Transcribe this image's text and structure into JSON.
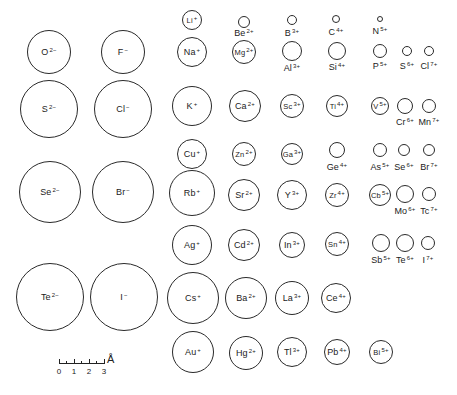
{
  "diagram": {
    "ions": [
      {
        "symbol": "O",
        "charge": "2−",
        "cx": 49,
        "cy": 52,
        "r": 22,
        "label_inside": true
      },
      {
        "symbol": "F",
        "charge": "−",
        "cx": 123,
        "cy": 52,
        "r": 22,
        "label_inside": true
      },
      {
        "symbol": "S",
        "charge": "2−",
        "cx": 49,
        "cy": 109,
        "r": 29,
        "label_inside": true
      },
      {
        "symbol": "Cl",
        "charge": "−",
        "cx": 123,
        "cy": 109,
        "r": 29,
        "label_inside": true
      },
      {
        "symbol": "Se",
        "charge": "2−",
        "cx": 50,
        "cy": 192,
        "r": 31,
        "label_inside": true
      },
      {
        "symbol": "Br",
        "charge": "−",
        "cx": 123,
        "cy": 192,
        "r": 31,
        "label_inside": true
      },
      {
        "symbol": "Te",
        "charge": "2−",
        "cx": 50,
        "cy": 297,
        "r": 34,
        "label_inside": true
      },
      {
        "symbol": "I",
        "charge": "−",
        "cx": 124,
        "cy": 297,
        "r": 34,
        "label_inside": true
      },
      {
        "symbol": "Li",
        "charge": "+",
        "cx": 192,
        "cy": 20,
        "r": 10,
        "label_inside": true
      },
      {
        "symbol": "Na",
        "charge": "+",
        "cx": 192,
        "cy": 52,
        "r": 15,
        "label_inside": true
      },
      {
        "symbol": "K",
        "charge": "+",
        "cx": 192,
        "cy": 106,
        "r": 20,
        "label_inside": true
      },
      {
        "symbol": "Cu",
        "charge": "+",
        "cx": 192,
        "cy": 154,
        "r": 15,
        "label_inside": true
      },
      {
        "symbol": "Rb",
        "charge": "+",
        "cx": 192,
        "cy": 193,
        "r": 23,
        "label_inside": true
      },
      {
        "symbol": "Ag",
        "charge": "+",
        "cx": 192,
        "cy": 245,
        "r": 20,
        "label_inside": true
      },
      {
        "symbol": "Cs",
        "charge": "+",
        "cx": 193,
        "cy": 298,
        "r": 26,
        "label_inside": true
      },
      {
        "symbol": "Au",
        "charge": "+",
        "cx": 193,
        "cy": 352,
        "r": 21,
        "label_inside": true
      },
      {
        "symbol": "Be",
        "charge": "2+",
        "cx": 244,
        "cy": 22,
        "r": 6,
        "label_inside": false,
        "ly": 33
      },
      {
        "symbol": "Mg",
        "charge": "2+",
        "cx": 244,
        "cy": 52,
        "r": 12,
        "label_inside": true
      },
      {
        "symbol": "Ca",
        "charge": "2+",
        "cx": 245,
        "cy": 106,
        "r": 16,
        "label_inside": true
      },
      {
        "symbol": "Zn",
        "charge": "2+",
        "cx": 244,
        "cy": 154,
        "r": 12,
        "label_inside": true
      },
      {
        "symbol": "Sr",
        "charge": "2+",
        "cx": 244,
        "cy": 195,
        "r": 16,
        "label_inside": true
      },
      {
        "symbol": "Cd",
        "charge": "2+",
        "cx": 244,
        "cy": 245,
        "r": 16,
        "label_inside": true
      },
      {
        "symbol": "Ba",
        "charge": "2+",
        "cx": 246,
        "cy": 298,
        "r": 21,
        "label_inside": true
      },
      {
        "symbol": "Hg",
        "charge": "2+",
        "cx": 246,
        "cy": 353,
        "r": 17,
        "label_inside": true
      },
      {
        "symbol": "B",
        "charge": "3+",
        "cx": 292,
        "cy": 20,
        "r": 5,
        "label_inside": false,
        "ly": 33
      },
      {
        "symbol": "Al",
        "charge": "3+",
        "cx": 292,
        "cy": 51,
        "r": 10,
        "label_inside": false,
        "ly": 68
      },
      {
        "symbol": "Sc",
        "charge": "3+",
        "cx": 292,
        "cy": 106,
        "r": 12,
        "label_inside": true
      },
      {
        "symbol": "Ga",
        "charge": "3+",
        "cx": 292,
        "cy": 154,
        "r": 11,
        "label_inside": true
      },
      {
        "symbol": "Y",
        "charge": "3+",
        "cx": 292,
        "cy": 195,
        "r": 15,
        "label_inside": true
      },
      {
        "symbol": "In",
        "charge": "3+",
        "cx": 292,
        "cy": 245,
        "r": 13,
        "label_inside": true
      },
      {
        "symbol": "La",
        "charge": "3+",
        "cx": 292,
        "cy": 298,
        "r": 17,
        "label_inside": true
      },
      {
        "symbol": "Tl",
        "charge": "3+",
        "cx": 292,
        "cy": 352,
        "r": 15,
        "label_inside": true
      },
      {
        "symbol": "C",
        "charge": "4+",
        "cx": 336,
        "cy": 19,
        "r": 4,
        "label_inside": false,
        "ly": 32
      },
      {
        "symbol": "Si",
        "charge": "4+",
        "cx": 337,
        "cy": 51,
        "r": 9,
        "label_inside": false,
        "ly": 67
      },
      {
        "symbol": "Ti",
        "charge": "4+",
        "cx": 337,
        "cy": 106,
        "r": 11,
        "label_inside": true
      },
      {
        "symbol": "Ge",
        "charge": "4+",
        "cx": 337,
        "cy": 150,
        "r": 8,
        "label_inside": false,
        "ly": 167
      },
      {
        "symbol": "Zr",
        "charge": "4+",
        "cx": 337,
        "cy": 195,
        "r": 12,
        "label_inside": true
      },
      {
        "symbol": "Sn",
        "charge": "4+",
        "cx": 337,
        "cy": 244,
        "r": 12,
        "label_inside": true
      },
      {
        "symbol": "Ce",
        "charge": "4+",
        "cx": 336,
        "cy": 298,
        "r": 15,
        "label_inside": true
      },
      {
        "symbol": "Pb",
        "charge": "4+",
        "cx": 337,
        "cy": 352,
        "r": 13,
        "label_inside": true
      },
      {
        "symbol": "N",
        "charge": "5+",
        "cx": 380,
        "cy": 19,
        "r": 3,
        "label_inside": false,
        "ly": 31
      },
      {
        "symbol": "P",
        "charge": "5+",
        "cx": 380,
        "cy": 51,
        "r": 7,
        "label_inside": false,
        "ly": 66
      },
      {
        "symbol": "V",
        "charge": "5+",
        "cx": 380,
        "cy": 106,
        "r": 9,
        "label_inside": true
      },
      {
        "symbol": "As",
        "charge": "5+",
        "cx": 380,
        "cy": 150,
        "r": 7,
        "label_inside": false,
        "ly": 167
      },
      {
        "symbol": "Cb",
        "charge": "5+",
        "cx": 380,
        "cy": 195,
        "r": 11,
        "label_inside": true
      },
      {
        "symbol": "Sb",
        "charge": "5+",
        "cx": 381,
        "cy": 243,
        "r": 9,
        "label_inside": false,
        "ly": 260
      },
      {
        "symbol": "Bi",
        "charge": "5+",
        "cx": 381,
        "cy": 352,
        "r": 12,
        "label_inside": true
      },
      {
        "symbol": "S",
        "charge": "6+",
        "cx": 407,
        "cy": 51,
        "r": 5,
        "label_inside": false,
        "ly": 66
      },
      {
        "symbol": "Cr",
        "charge": "6+",
        "cx": 405,
        "cy": 106,
        "r": 8,
        "label_inside": false,
        "ly": 122
      },
      {
        "symbol": "Se",
        "charge": "6+",
        "cx": 404,
        "cy": 150,
        "r": 6,
        "label_inside": false,
        "ly": 167
      },
      {
        "symbol": "Mo",
        "charge": "6+",
        "cx": 405,
        "cy": 194,
        "r": 9,
        "label_inside": false,
        "ly": 211
      },
      {
        "symbol": "Te",
        "charge": "6+",
        "cx": 405,
        "cy": 243,
        "r": 9,
        "label_inside": false,
        "ly": 260
      },
      {
        "symbol": "Cl",
        "charge": "7+",
        "cx": 429,
        "cy": 51,
        "r": 5,
        "label_inside": false,
        "ly": 66
      },
      {
        "symbol": "Mn",
        "charge": "7+",
        "cx": 429,
        "cy": 106,
        "r": 7,
        "label_inside": false,
        "ly": 122
      },
      {
        "symbol": "Br",
        "charge": "7+",
        "cx": 429,
        "cy": 150,
        "r": 6,
        "label_inside": false,
        "ly": 167
      },
      {
        "symbol": "Tc",
        "charge": "7+",
        "cx": 429,
        "cy": 194,
        "r": 7,
        "label_inside": false,
        "ly": 211
      },
      {
        "symbol": "I",
        "charge": "7+",
        "cx": 428,
        "cy": 243,
        "r": 7,
        "label_inside": false,
        "ly": 260
      }
    ],
    "scale_bar": {
      "labels": [
        "0",
        "1",
        "2",
        "3"
      ],
      "unit": "Å",
      "px_per_unit": 15
    }
  }
}
